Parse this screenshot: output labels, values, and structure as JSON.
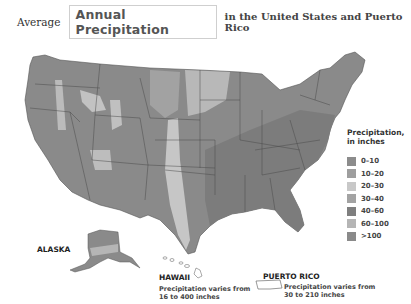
{
  "header": {
    "prefix": "Average",
    "title": "Annual Precipitation",
    "suffix": "in the United States and Puerto Rico"
  },
  "legend": {
    "title_line1": "Precipitation,",
    "title_line2": "in inches",
    "items": [
      {
        "label": "0–10",
        "color": "#8c8c8c"
      },
      {
        "label": "10–20",
        "color": "#9e9e9e"
      },
      {
        "label": "20–30",
        "color": "#c8c8c8"
      },
      {
        "label": "30–40",
        "color": "#a3a3a3"
      },
      {
        "label": "40–60",
        "color": "#7f7f7f"
      },
      {
        "label": "60–100",
        "color": "#b5b5b5"
      },
      {
        "label": ">100",
        "color": "#8a8a8a"
      }
    ]
  },
  "regions": {
    "alaska": {
      "label": "ALASKA"
    },
    "hawaii": {
      "label": "HAWAII",
      "note_line1": "Precipitation varies from",
      "note_line2": "16 to 400 inches"
    },
    "puerto_rico": {
      "label": "PUERTO RICO",
      "note_line1": "Precipitation varies from",
      "note_line2": "30 to 210 inches"
    }
  },
  "colors": {
    "background": "#ffffff",
    "state_border": "#444444",
    "land_wet": "#7f7f7f",
    "land_mid": "#999999",
    "land_dry": "#c8c8c8"
  }
}
